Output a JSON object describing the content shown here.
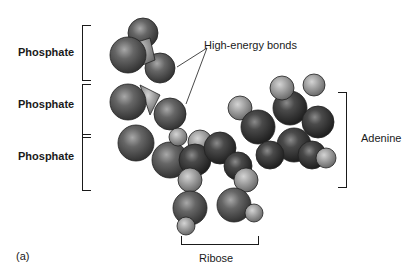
{
  "labels": {
    "phosphate_1": "Phosphate",
    "phosphate_2": "Phosphate",
    "phosphate_3": "Phosphate",
    "high_energy_bonds": "High-energy bonds",
    "adenine": "Adenine",
    "ribose": "Ribose",
    "panel": "(a)"
  },
  "colors": {
    "background": "#ffffff",
    "dark_atom": "#3a3a3a",
    "mid_atom": "#5e5e5e",
    "light_atom": "#9a9a9a",
    "text": "#1a1a1a"
  }
}
